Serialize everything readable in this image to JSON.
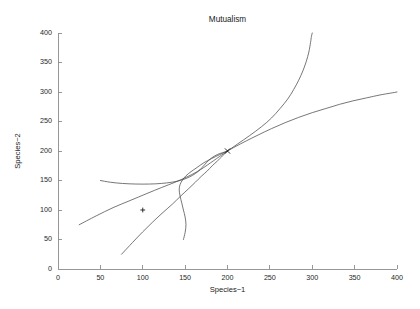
{
  "chart_data": {
    "type": "line",
    "title": "Mutualism",
    "xlabel": "Species−1",
    "ylabel": "Species−2",
    "xlim": [
      0,
      400
    ],
    "ylim": [
      0,
      400
    ],
    "xticks": [
      0,
      50,
      100,
      150,
      200,
      250,
      300,
      350,
      400
    ],
    "yticks": [
      0,
      50,
      100,
      150,
      200,
      250,
      300,
      350,
      400
    ],
    "xticklabels": [
      "0",
      "50",
      "100",
      "150",
      "200",
      "250",
      "300",
      "350",
      "400"
    ],
    "yticklabels": [
      "0",
      "50",
      "100",
      "150",
      "200",
      "250",
      "300",
      "350",
      "400"
    ],
    "grid": false,
    "legend": null,
    "line_color": "#4a4a4a",
    "axis_color": "#8c8c8c",
    "background_color": "#ffffff",
    "annotations": [
      {
        "name": "equilibrium-marker",
        "symbol": "x",
        "x": 200,
        "y": 200,
        "label": ""
      },
      {
        "name": "initial-point-marker",
        "symbol": "+",
        "x": 100,
        "y": 100,
        "label": ""
      }
    ],
    "series": [
      {
        "name": "trajectory-upper-saturating",
        "note": "rises from equilibrium and saturates toward y=300 at x=400",
        "points": [
          [
            200,
            200
          ],
          [
            210,
            208
          ],
          [
            222,
            217
          ],
          [
            236,
            227
          ],
          [
            252,
            238
          ],
          [
            268,
            248
          ],
          [
            284,
            257
          ],
          [
            300,
            265
          ],
          [
            316,
            272
          ],
          [
            332,
            279
          ],
          [
            348,
            285
          ],
          [
            364,
            290
          ],
          [
            380,
            295
          ],
          [
            392,
            298
          ],
          [
            400,
            300
          ]
        ]
      },
      {
        "name": "trajectory-blowup",
        "note": "rises steeply from equilibrium to y=400 near x=300",
        "points": [
          [
            200,
            200
          ],
          [
            212,
            212
          ],
          [
            226,
            226
          ],
          [
            240,
            241
          ],
          [
            252,
            256
          ],
          [
            262,
            272
          ],
          [
            271,
            288
          ],
          [
            278,
            304
          ],
          [
            284,
            320
          ],
          [
            289,
            336
          ],
          [
            293,
            352
          ],
          [
            296,
            368
          ],
          [
            298,
            384
          ],
          [
            299,
            394
          ],
          [
            300,
            400
          ]
        ]
      },
      {
        "name": "trajectory-flat-left",
        "note": "from (50,150) curving right and up into the equilibrium",
        "points": [
          [
            50,
            150
          ],
          [
            62,
            147
          ],
          [
            76,
            145
          ],
          [
            92,
            144
          ],
          [
            108,
            144
          ],
          [
            122,
            145
          ],
          [
            134,
            147
          ],
          [
            144,
            150
          ],
          [
            152,
            154
          ],
          [
            159,
            159
          ],
          [
            165,
            165
          ],
          [
            170,
            172
          ],
          [
            175,
            180
          ],
          [
            181,
            188
          ],
          [
            188,
            194
          ],
          [
            196,
            198
          ],
          [
            200,
            200
          ]
        ]
      },
      {
        "name": "trajectory-shallow-diagonal",
        "note": "from (25,75) rising nearly straight through mid-field to equilibrium",
        "points": [
          [
            25,
            75
          ],
          [
            45,
            90
          ],
          [
            65,
            104
          ],
          [
            85,
            116
          ],
          [
            105,
            128
          ],
          [
            122,
            138
          ],
          [
            138,
            147
          ],
          [
            152,
            156
          ],
          [
            163,
            164
          ],
          [
            172,
            172
          ],
          [
            180,
            180
          ],
          [
            187,
            187
          ],
          [
            193,
            193
          ],
          [
            197,
            197
          ],
          [
            200,
            200
          ]
        ]
      },
      {
        "name": "trajectory-steep-from-bottom",
        "note": "from (75,25) rising steeply up-right into the equilibrium",
        "points": [
          [
            75,
            25
          ],
          [
            88,
            45
          ],
          [
            100,
            63
          ],
          [
            112,
            80
          ],
          [
            124,
            96
          ],
          [
            135,
            110
          ],
          [
            145,
            124
          ],
          [
            154,
            136
          ],
          [
            162,
            147
          ],
          [
            169,
            157
          ],
          [
            176,
            166
          ],
          [
            182,
            175
          ],
          [
            188,
            183
          ],
          [
            193,
            190
          ],
          [
            197,
            196
          ],
          [
            200,
            200
          ]
        ]
      },
      {
        "name": "trajectory-hook-from-bottom",
        "note": "from (148,50) curving left then up sharply into the equilibrium",
        "points": [
          [
            148,
            50
          ],
          [
            150,
            62
          ],
          [
            151,
            75
          ],
          [
            150,
            88
          ],
          [
            148,
            100
          ],
          [
            146,
            112
          ],
          [
            144,
            124
          ],
          [
            143,
            134
          ],
          [
            144,
            143
          ],
          [
            147,
            151
          ],
          [
            151,
            158
          ],
          [
            157,
            165
          ],
          [
            164,
            172
          ],
          [
            172,
            180
          ],
          [
            181,
            187
          ],
          [
            191,
            194
          ],
          [
            200,
            200
          ]
        ]
      }
    ]
  }
}
